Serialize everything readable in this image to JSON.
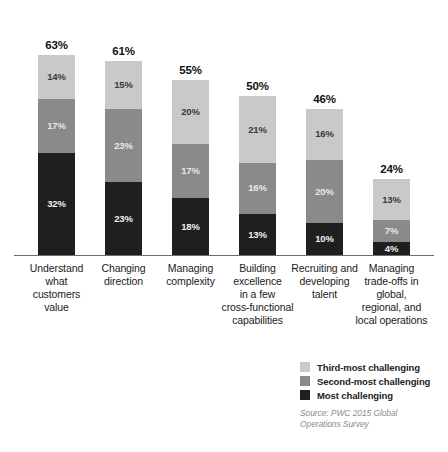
{
  "chart_data": {
    "type": "bar",
    "subtype": "stacked-bar",
    "title": "",
    "xlabel": "",
    "ylabel": "",
    "ylim": [
      0,
      70
    ],
    "grid": false,
    "legend_position": "bottom-right",
    "categories": [
      "Understand what customers value",
      "Changing direction",
      "Managing complexity",
      "Building excellence in a few cross-functional capabilities",
      "Recruiting and developing talent",
      "Managing trade-offs in global, regional, and local operations"
    ],
    "series": [
      {
        "name": "Most challenging",
        "color": "#1f1f1f",
        "values": [
          32,
          23,
          18,
          13,
          10,
          4
        ]
      },
      {
        "name": "Second-most challenging",
        "color": "#8a8a8a",
        "values": [
          17,
          23,
          17,
          16,
          20,
          7
        ]
      },
      {
        "name": "Third-most challenging",
        "color": "#c9c9c9",
        "values": [
          14,
          15,
          20,
          21,
          16,
          13
        ]
      }
    ],
    "totals": [
      63,
      61,
      55,
      50,
      46,
      24
    ],
    "value_suffix": "%",
    "source": "Source: PWC 2015 Global Operations Survey"
  },
  "bars": [
    {
      "total_label": "63%",
      "category_lines": [
        "Understand",
        "what",
        "customers",
        "value"
      ],
      "segments": [
        {
          "tier": "light",
          "label": "14%"
        },
        {
          "tier": "mid",
          "label": "17%"
        },
        {
          "tier": "dark",
          "label": "32%"
        }
      ]
    },
    {
      "total_label": "61%",
      "category_lines": [
        "Changing",
        "direction"
      ],
      "segments": [
        {
          "tier": "light",
          "label": "15%"
        },
        {
          "tier": "mid",
          "label": "23%"
        },
        {
          "tier": "dark",
          "label": "23%"
        }
      ]
    },
    {
      "total_label": "55%",
      "category_lines": [
        "Managing",
        "complexity"
      ],
      "segments": [
        {
          "tier": "light",
          "label": "20%"
        },
        {
          "tier": "mid",
          "label": "17%"
        },
        {
          "tier": "dark",
          "label": "18%"
        }
      ]
    },
    {
      "total_label": "50%",
      "category_lines": [
        "Building",
        "excellence",
        "in a few",
        "cross-functional",
        "capabilities"
      ],
      "segments": [
        {
          "tier": "light",
          "label": "21%"
        },
        {
          "tier": "mid",
          "label": "16%"
        },
        {
          "tier": "dark",
          "label": "13%"
        }
      ]
    },
    {
      "total_label": "46%",
      "category_lines": [
        "Recruiting and",
        "developing",
        "talent"
      ],
      "segments": [
        {
          "tier": "light",
          "label": "16%"
        },
        {
          "tier": "mid",
          "label": "20%"
        },
        {
          "tier": "dark",
          "label": "10%"
        }
      ]
    },
    {
      "total_label": "24%",
      "category_lines": [
        "Managing",
        "trade-offs in",
        "global,",
        "regional, and",
        "local operations"
      ],
      "segments": [
        {
          "tier": "light",
          "label": "13%"
        },
        {
          "tier": "mid",
          "label": "7%"
        },
        {
          "tier": "dark",
          "label": "4%"
        }
      ]
    }
  ],
  "legend": {
    "items": [
      {
        "tier": "light",
        "label": "Third-most challenging"
      },
      {
        "tier": "mid",
        "label": "Second-most challenging"
      },
      {
        "tier": "dark",
        "label": "Most challenging"
      }
    ]
  },
  "source": {
    "line1": "Source: PWC 2015 Global",
    "line2": "Operations Survey"
  },
  "colors": {
    "light": "#c9c9c9",
    "mid": "#8a8a8a",
    "dark": "#1f1f1f",
    "axis": "#6e6e6e",
    "source_text": "#8d8d8d"
  }
}
